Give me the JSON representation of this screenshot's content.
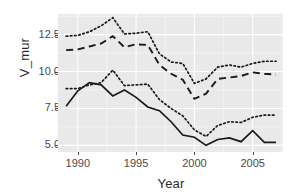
{
  "chart_data": {
    "type": "line",
    "title": "",
    "xlabel": "Year",
    "ylabel": "V_mur",
    "xlim": [
      1988.3,
      2007.6
    ],
    "ylim": [
      4.55,
      13.9
    ],
    "grid": true,
    "legend": "none",
    "background": "#e9e9e9",
    "gridline_color": "#ffffff",
    "line_color": "#1a1a1a",
    "x_ticks": [
      1990,
      1995,
      2000,
      2005
    ],
    "x_tick_labels": [
      "1990",
      "1995",
      "2000",
      "2005"
    ],
    "y_ticks": [
      5.0,
      7.5,
      10.0,
      12.5
    ],
    "y_tick_labels": [
      "5.0",
      "7.5",
      "10.0",
      "12.5"
    ],
    "x": [
      1989,
      1990,
      1991,
      1992,
      1993,
      1994,
      1995,
      1996,
      1997,
      1998,
      1999,
      2000,
      2001,
      2002,
      2003,
      2004,
      2005,
      2006,
      2007
    ],
    "series": [
      {
        "name": "estimate",
        "linetype": "solid",
        "values": [
          7.65,
          8.7,
          9.25,
          9.1,
          8.35,
          8.75,
          8.25,
          7.6,
          7.35,
          6.6,
          5.7,
          5.55,
          5.0,
          5.4,
          5.5,
          5.25,
          6.0,
          5.2,
          5.2
        ]
      },
      {
        "name": "upper-estimate",
        "linetype": "dashed",
        "values": [
          11.45,
          11.5,
          11.7,
          11.9,
          12.4,
          11.65,
          11.85,
          11.8,
          10.45,
          9.85,
          9.45,
          8.15,
          8.5,
          9.5,
          9.6,
          9.7,
          9.95,
          9.85,
          9.8
        ]
      },
      {
        "name": "upper-band",
        "linetype": "dotted",
        "values": [
          12.4,
          12.45,
          12.7,
          13.1,
          13.65,
          12.55,
          12.6,
          12.7,
          11.2,
          10.65,
          10.55,
          9.2,
          9.5,
          10.3,
          10.45,
          10.3,
          10.55,
          10.7,
          10.7
        ]
      },
      {
        "name": "lower-band",
        "linetype": "dotted",
        "values": [
          8.85,
          8.85,
          9.1,
          9.25,
          10.1,
          9.05,
          9.1,
          9.15,
          8.1,
          7.5,
          7.0,
          6.05,
          5.6,
          6.35,
          6.6,
          6.55,
          6.9,
          7.05,
          7.05
        ]
      }
    ]
  },
  "axis": {
    "x_title": "Year",
    "y_title": "V_mur"
  }
}
